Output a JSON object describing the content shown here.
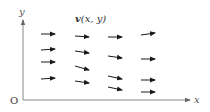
{
  "diagram": {
    "title_bold": "v",
    "title_rest": "(x, y)",
    "axis_x_label": "x",
    "axis_y_label": "y",
    "origin_label": "O",
    "colors": {
      "axis": "#888888",
      "arrow": "#1a1a1a",
      "text": "#333333"
    }
  },
  "vectors": [
    {
      "x1": 41,
      "y1": 34,
      "x2": 55,
      "y2": 34
    },
    {
      "x1": 41,
      "y1": 50,
      "x2": 55,
      "y2": 49
    },
    {
      "x1": 41,
      "y1": 62,
      "x2": 55,
      "y2": 62
    },
    {
      "x1": 41,
      "y1": 79,
      "x2": 55,
      "y2": 78
    },
    {
      "x1": 75,
      "y1": 36,
      "x2": 89,
      "y2": 37
    },
    {
      "x1": 75,
      "y1": 51,
      "x2": 89,
      "y2": 53
    },
    {
      "x1": 75,
      "y1": 66,
      "x2": 89,
      "y2": 70
    },
    {
      "x1": 75,
      "y1": 81,
      "x2": 89,
      "y2": 83
    },
    {
      "x1": 108,
      "y1": 37,
      "x2": 122,
      "y2": 37
    },
    {
      "x1": 108,
      "y1": 56,
      "x2": 122,
      "y2": 58
    },
    {
      "x1": 108,
      "y1": 76,
      "x2": 122,
      "y2": 79
    },
    {
      "x1": 108,
      "y1": 87,
      "x2": 122,
      "y2": 90
    },
    {
      "x1": 141,
      "y1": 35,
      "x2": 155,
      "y2": 33
    },
    {
      "x1": 141,
      "y1": 59,
      "x2": 155,
      "y2": 59
    },
    {
      "x1": 141,
      "y1": 80,
      "x2": 155,
      "y2": 80
    },
    {
      "x1": 141,
      "y1": 92,
      "x2": 155,
      "y2": 92
    }
  ]
}
